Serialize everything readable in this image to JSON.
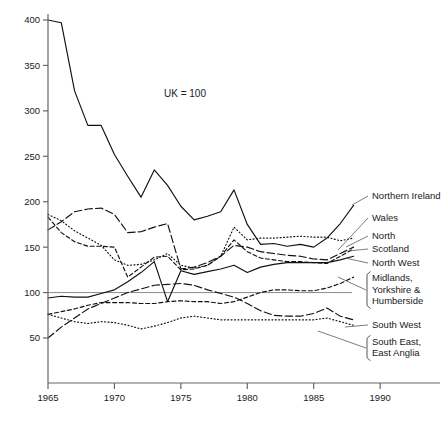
{
  "chart_data": {
    "type": "line",
    "title": "",
    "annotation": "UK = 100",
    "xlabel": "",
    "ylabel": "",
    "xlim": [
      1965,
      1993
    ],
    "ylim": [
      0,
      400
    ],
    "xticks": [
      1965,
      1970,
      1975,
      1980,
      1985,
      1990
    ],
    "yticks": [
      50,
      100,
      150,
      200,
      250,
      300,
      350,
      400
    ],
    "grid": false,
    "legend_position": "right-inline",
    "reference_line": {
      "value": 100,
      "label": "UK = 100"
    },
    "series": [
      {
        "name": "Northern Ireland",
        "dash": "solid",
        "x": [
          1965,
          1966,
          1967,
          1968,
          1969,
          1970,
          1971,
          1972,
          1973,
          1974,
          1975,
          1976,
          1977,
          1978,
          1979,
          1980,
          1981,
          1982,
          1983,
          1984,
          1985,
          1986,
          1987,
          1988
        ],
        "values": [
          400,
          397,
          322,
          284,
          284,
          252,
          228,
          205,
          235,
          218,
          195,
          180,
          184,
          189,
          213,
          175,
          153,
          154,
          151,
          153,
          150,
          160,
          176,
          196
        ]
      },
      {
        "name": "Wales",
        "dash": "dotted",
        "x": [
          1965,
          1966,
          1967,
          1968,
          1969,
          1970,
          1971,
          1972,
          1973,
          1974,
          1975,
          1976,
          1977,
          1978,
          1979,
          1980,
          1981,
          1982,
          1983,
          1984,
          1985,
          1986,
          1987,
          1988
        ],
        "values": [
          186,
          179,
          168,
          160,
          152,
          136,
          130,
          131,
          136,
          143,
          130,
          127,
          130,
          140,
          172,
          158,
          160,
          160,
          161,
          162,
          161,
          161,
          157,
          160
        ]
      },
      {
        "name": "North",
        "dash": "long-dash",
        "x": [
          1965,
          1966,
          1967,
          1968,
          1969,
          1970,
          1971,
          1972,
          1973,
          1974,
          1975,
          1976,
          1977,
          1978,
          1979,
          1980,
          1981,
          1982,
          1983,
          1984,
          1985,
          1986,
          1987,
          1988
        ],
        "values": [
          169,
          178,
          189,
          192,
          193,
          186,
          166,
          167,
          172,
          176,
          126,
          128,
          133,
          140,
          152,
          150,
          145,
          143,
          141,
          140,
          137,
          136,
          143,
          150
        ]
      },
      {
        "name": "Scotland",
        "dash": "dash",
        "x": [
          1965,
          1966,
          1967,
          1968,
          1969,
          1970,
          1971,
          1972,
          1973,
          1974,
          1975,
          1976,
          1977,
          1978,
          1979,
          1980,
          1981,
          1982,
          1983,
          1984,
          1985,
          1986,
          1987,
          1988
        ],
        "values": [
          183,
          166,
          156,
          151,
          151,
          150,
          117,
          128,
          139,
          140,
          125,
          126,
          130,
          140,
          158,
          145,
          138,
          136,
          134,
          134,
          133,
          132,
          140,
          148
        ]
      },
      {
        "name": "North West",
        "dash": "solid",
        "x": [
          1965,
          1966,
          1967,
          1968,
          1969,
          1970,
          1971,
          1972,
          1973,
          1974,
          1975,
          1976,
          1977,
          1978,
          1979,
          1980,
          1981,
          1982,
          1983,
          1984,
          1985,
          1986,
          1987,
          1988
        ],
        "values": [
          94,
          96,
          95,
          95,
          99,
          103,
          112,
          122,
          134,
          90,
          124,
          120,
          123,
          126,
          130,
          122,
          128,
          131,
          133,
          133,
          133,
          133,
          136,
          140
        ]
      },
      {
        "name": "Midlands, Yorkshire & Humberside",
        "dash": "dash",
        "x": [
          1965,
          1966,
          1967,
          1968,
          1969,
          1970,
          1971,
          1972,
          1973,
          1974,
          1975,
          1976,
          1977,
          1978,
          1979,
          1980,
          1981,
          1982,
          1983,
          1984,
          1985,
          1986,
          1987,
          1988
        ],
        "values": [
          76,
          79,
          82,
          86,
          89,
          89,
          89,
          88,
          88,
          90,
          91,
          90,
          90,
          88,
          90,
          95,
          100,
          103,
          103,
          102,
          102,
          105,
          110,
          117
        ]
      },
      {
        "name": "South West",
        "dash": "dotted",
        "x": [
          1965,
          1966,
          1967,
          1968,
          1969,
          1970,
          1971,
          1972,
          1973,
          1974,
          1975,
          1976,
          1977,
          1978,
          1979,
          1980,
          1981,
          1982,
          1983,
          1984,
          1985,
          1986,
          1987,
          1988
        ],
        "values": [
          76,
          72,
          68,
          66,
          68,
          67,
          64,
          60,
          63,
          67,
          72,
          74,
          72,
          70,
          70,
          70,
          70,
          70,
          70,
          70,
          70,
          72,
          68,
          64
        ]
      },
      {
        "name": "South East, East Anglia",
        "dash": "long-dash",
        "x": [
          1965,
          1966,
          1967,
          1968,
          1969,
          1970,
          1971,
          1972,
          1973,
          1974,
          1975,
          1976,
          1977,
          1978,
          1979,
          1980,
          1981,
          1982,
          1983,
          1984,
          1985,
          1986,
          1987,
          1988
        ],
        "values": [
          50,
          62,
          72,
          82,
          88,
          94,
          100,
          104,
          108,
          109,
          110,
          108,
          103,
          99,
          95,
          88,
          80,
          75,
          74,
          74,
          77,
          83,
          74,
          70
        ]
      }
    ],
    "legend_entries": [
      {
        "label": "Northern Ireland",
        "y": 196,
        "bracket": false,
        "lines": [
          "Northern Ireland"
        ]
      },
      {
        "label": "Wales",
        "y": 218,
        "bracket": false,
        "lines": [
          "Wales"
        ]
      },
      {
        "label": "North",
        "y": 236,
        "bracket": false,
        "lines": [
          "North"
        ]
      },
      {
        "label": "Scotland",
        "y": 249,
        "bracket": false,
        "lines": [
          "Scotland"
        ]
      },
      {
        "label": "North West",
        "y": 263,
        "bracket": false,
        "lines": [
          "North West"
        ]
      },
      {
        "label": "Midlands, Yorkshire & Humberside",
        "y": 290,
        "bracket": true,
        "lines": [
          "Midlands,",
          "Yorkshire &",
          "Humberside"
        ]
      },
      {
        "label": "South West",
        "y": 325,
        "bracket": false,
        "lines": [
          "South West"
        ]
      },
      {
        "label": "South East, East Anglia",
        "y": 348,
        "bracket": true,
        "lines": [
          "South East,",
          "East Anglia"
        ]
      }
    ],
    "colors": {
      "line": "#111111",
      "axis": "#666666",
      "reference": "#8a8a8a",
      "text": "#1a1a1a"
    }
  }
}
